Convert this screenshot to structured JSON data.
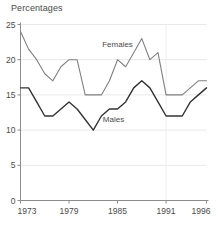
{
  "chart_data": {
    "type": "line",
    "title": "Percentages",
    "xlabel": "",
    "ylabel": "",
    "xlim": [
      1973,
      1996
    ],
    "ylim": [
      0,
      25
    ],
    "xticks": [
      1973,
      1979,
      1985,
      1991,
      1996
    ],
    "yticks": [
      0,
      5,
      10,
      15,
      20,
      25
    ],
    "grid": true,
    "legend_position": "inline-annotation",
    "x": [
      1973,
      1974,
      1975,
      1976,
      1977,
      1978,
      1979,
      1980,
      1981,
      1982,
      1983,
      1984,
      1985,
      1986,
      1987,
      1988,
      1989,
      1990,
      1991,
      1992,
      1993,
      1994,
      1995,
      1996
    ],
    "series": [
      {
        "name": "Females",
        "color": "#808080",
        "values": [
          24,
          21.5,
          20,
          18,
          17,
          19,
          20,
          20,
          15,
          15,
          15,
          17,
          20,
          19,
          21,
          23,
          20,
          21,
          15,
          15,
          15,
          16,
          17,
          17
        ]
      },
      {
        "name": "Males",
        "color": "#333333",
        "values": [
          16,
          16,
          14,
          12,
          12,
          13,
          14,
          13,
          11.5,
          10,
          12,
          13,
          13,
          14,
          16,
          17,
          16,
          14,
          12,
          12,
          12,
          14,
          15,
          16
        ]
      }
    ],
    "annotations": [
      {
        "text": "Females",
        "x": 1985,
        "y": 21.8
      },
      {
        "text": "Males",
        "x": 1984.5,
        "y": 11.2
      }
    ],
    "axis_color": "#8c8c8c",
    "grid_color": "#e8e8e8",
    "text_color": "#4a4a4a"
  }
}
